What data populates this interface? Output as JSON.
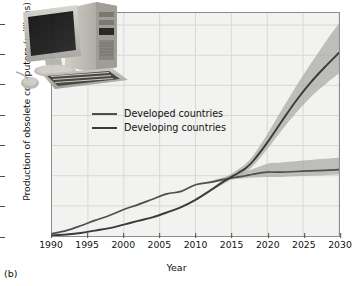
{
  "figure": {
    "panel_caption": "(b)",
    "xlabel": "Year",
    "ylabel": "Production of obsolete computers (millions)"
  },
  "legend": {
    "position": "inside-upper-left",
    "items": [
      {
        "label": "Developed countries",
        "color": "#4e4e4e"
      },
      {
        "label": "Developing countries",
        "color": "#3a3a3a"
      }
    ]
  },
  "axes": {
    "y_ticks": [
      "0",
      "100",
      "200",
      "300",
      "400",
      "500",
      "600",
      "700"
    ],
    "x_ticks": [
      "1990",
      "1995",
      "2000",
      "2005",
      "2010",
      "2015",
      "2020",
      "2025",
      "2030"
    ]
  },
  "photo": {
    "alt": "desktop-computer-monitor-tower-keyboard-mouse"
  },
  "colors": {
    "plot_background": "#f2f2f0",
    "grid": "#d8d8d4",
    "frame": "#8d8d8d",
    "band": "#a8a8a4",
    "developed_line": "#4e4e4e",
    "developing_line": "#3a3a3a"
  },
  "chart_data": {
    "type": "line",
    "title": "",
    "xlabel": "Year",
    "ylabel": "Production of obsolete computers (millions)",
    "xlim": [
      1990,
      2030
    ],
    "ylim": [
      0,
      740
    ],
    "xticks": [
      1990,
      1995,
      2000,
      2005,
      2010,
      2015,
      2020,
      2025,
      2030
    ],
    "yticks": [
      0,
      100,
      200,
      300,
      400,
      500,
      600,
      700
    ],
    "grid": true,
    "legend_position": "upper left (inside)",
    "annotations": [
      "Inset photograph of a desktop computer, monitor, keyboard and mouse"
    ],
    "x": [
      1990,
      1992,
      1994,
      1996,
      1998,
      2000,
      2002,
      2004,
      2006,
      2008,
      2010,
      2012,
      2014,
      2016,
      2017,
      2018,
      2020,
      2022,
      2024,
      2026,
      2028,
      2030
    ],
    "series": [
      {
        "name": "Developed countries",
        "values": [
          8,
          18,
          34,
          52,
          68,
          88,
          104,
          122,
          140,
          148,
          170,
          178,
          188,
          196,
          200,
          205,
          212,
          212,
          214,
          216,
          218,
          220
        ],
        "band_low": [
          8,
          18,
          34,
          52,
          68,
          88,
          104,
          122,
          140,
          148,
          170,
          176,
          184,
          190,
          192,
          194,
          196,
          196,
          198,
          200,
          202,
          204
        ],
        "band_high": [
          8,
          18,
          34,
          52,
          68,
          88,
          104,
          122,
          140,
          148,
          170,
          182,
          196,
          208,
          214,
          222,
          240,
          244,
          248,
          252,
          256,
          260
        ]
      },
      {
        "name": "Developing countries",
        "values": [
          2,
          5,
          10,
          18,
          26,
          38,
          50,
          62,
          78,
          96,
          120,
          150,
          182,
          210,
          225,
          248,
          310,
          380,
          448,
          508,
          560,
          608
        ],
        "band_low": [
          2,
          5,
          10,
          18,
          26,
          38,
          50,
          62,
          78,
          96,
          120,
          146,
          174,
          200,
          212,
          232,
          288,
          350,
          408,
          460,
          502,
          540
        ],
        "band_high": [
          2,
          5,
          10,
          18,
          26,
          38,
          50,
          62,
          78,
          96,
          120,
          154,
          190,
          222,
          240,
          266,
          338,
          418,
          496,
          570,
          640,
          706
        ]
      }
    ]
  }
}
